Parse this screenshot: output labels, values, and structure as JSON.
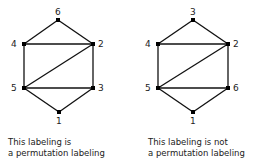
{
  "graphs": [
    {
      "id": "left",
      "nodes": [
        {
          "label": "6",
          "x": 58,
          "y": 20,
          "lx": 55,
          "ly": 15
        },
        {
          "label": "4",
          "x": 24,
          "y": 44,
          "lx": 11,
          "ly": 47
        },
        {
          "label": "2",
          "x": 93,
          "y": 44,
          "lx": 98,
          "ly": 47
        },
        {
          "label": "5",
          "x": 24,
          "y": 88,
          "lx": 11,
          "ly": 91
        },
        {
          "label": "3",
          "x": 93,
          "y": 88,
          "lx": 98,
          "ly": 91
        },
        {
          "label": "1",
          "x": 59,
          "y": 112,
          "lx": 56,
          "ly": 124
        }
      ],
      "caption_line1": "This labeling is",
      "caption_line2": "a permutation labeling"
    },
    {
      "id": "right",
      "nodes": [
        {
          "label": "3",
          "x": 193,
          "y": 20,
          "lx": 190,
          "ly": 15
        },
        {
          "label": "4",
          "x": 158,
          "y": 44,
          "lx": 145,
          "ly": 47
        },
        {
          "label": "2",
          "x": 228,
          "y": 44,
          "lx": 233,
          "ly": 47
        },
        {
          "label": "5",
          "x": 158,
          "y": 88,
          "lx": 145,
          "ly": 91
        },
        {
          "label": "6",
          "x": 228,
          "y": 88,
          "lx": 233,
          "ly": 91
        },
        {
          "label": "1",
          "x": 193,
          "y": 112,
          "lx": 190,
          "ly": 124
        }
      ],
      "caption_line1": "This labeling is not",
      "caption_line2": "a permutation labeling"
    }
  ],
  "edges": [
    [
      0,
      1
    ],
    [
      0,
      2
    ],
    [
      1,
      2
    ],
    [
      1,
      3
    ],
    [
      2,
      4
    ],
    [
      2,
      3
    ],
    [
      3,
      4
    ],
    [
      3,
      5
    ],
    [
      4,
      5
    ]
  ]
}
